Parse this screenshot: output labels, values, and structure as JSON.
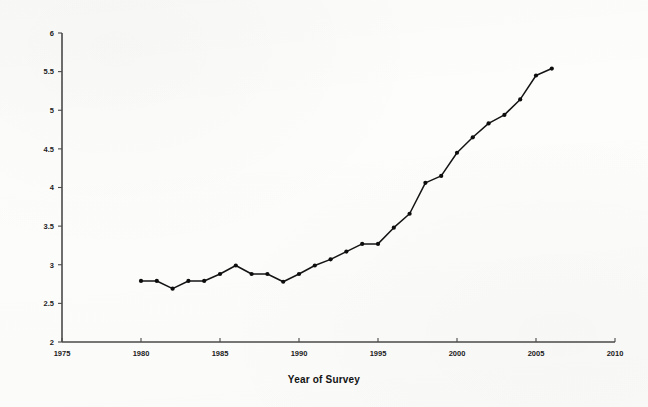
{
  "chart_data": {
    "type": "line",
    "title": "",
    "xlabel": "Year of Survey",
    "ylabel": "",
    "xlim": [
      1975,
      2010
    ],
    "ylim": [
      2,
      6
    ],
    "grid": false,
    "legend": false,
    "x_ticks": [
      1975,
      1980,
      1985,
      1990,
      1995,
      2000,
      2005,
      2010
    ],
    "x_tick_labels": [
      "1975",
      "1980",
      "1985",
      "1990",
      "1995",
      "2000",
      "2005",
      "2010"
    ],
    "y_ticks": [
      2,
      2.5,
      3,
      3.5,
      4,
      4.5,
      5,
      5.5,
      6
    ],
    "y_tick_labels": [
      "2",
      "2.5",
      "3",
      "3.5",
      "4",
      "4.5",
      "5",
      "5.5",
      "6"
    ],
    "marker": "filled-circle",
    "line_color": "#141414",
    "marker_color": "#0d0d0d",
    "x": [
      1980,
      1981,
      1982,
      1983,
      1984,
      1985,
      1986,
      1987,
      1988,
      1989,
      1990,
      1991,
      1992,
      1993,
      1994,
      1995,
      1996,
      1997,
      1998,
      1999,
      2000,
      2001,
      2002,
      2003,
      2004,
      2005,
      2006
    ],
    "values": [
      2.79,
      2.79,
      2.69,
      2.79,
      2.79,
      2.88,
      2.99,
      2.88,
      2.88,
      2.78,
      2.88,
      2.99,
      3.07,
      3.17,
      3.27,
      3.27,
      3.48,
      3.66,
      4.06,
      4.15,
      4.45,
      4.65,
      4.83,
      4.94,
      5.14,
      5.45,
      5.54
    ],
    "series": [
      {
        "name": "Survey value",
        "values": [
          2.79,
          2.79,
          2.69,
          2.79,
          2.79,
          2.88,
          2.99,
          2.88,
          2.88,
          2.78,
          2.88,
          2.99,
          3.07,
          3.17,
          3.27,
          3.27,
          3.48,
          3.66,
          4.06,
          4.15,
          4.45,
          4.65,
          4.83,
          4.94,
          5.14,
          5.45,
          5.54
        ]
      }
    ]
  },
  "figure": {
    "background_color": "#fdfdfc",
    "axis_color": "#4a4a4a"
  }
}
